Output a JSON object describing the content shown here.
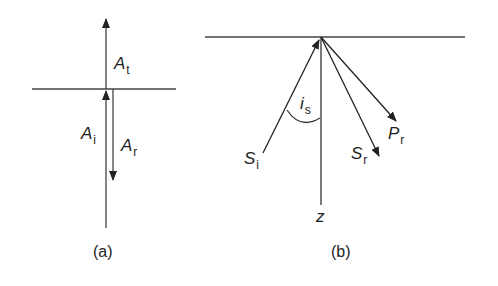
{
  "figure": {
    "panels": [
      {
        "id": "a",
        "caption": "(a)",
        "labels": {
          "transmitted": {
            "main": "A",
            "sub": "t"
          },
          "incident": {
            "main": "A",
            "sub": "i"
          },
          "reflected": {
            "main": "A",
            "sub": "r"
          }
        }
      },
      {
        "id": "b",
        "caption": "(b)",
        "labels": {
          "incident_s": {
            "main": "S",
            "sub": "i"
          },
          "reflected_s": {
            "main": "S",
            "sub": "r"
          },
          "reflected_p": {
            "main": "P",
            "sub": "r"
          },
          "angle": {
            "main": "i",
            "sub": "s"
          },
          "depth_axis": {
            "main": "z"
          }
        }
      }
    ],
    "colors": {
      "line": "#2a2a2a",
      "background": "#ffffff"
    }
  }
}
